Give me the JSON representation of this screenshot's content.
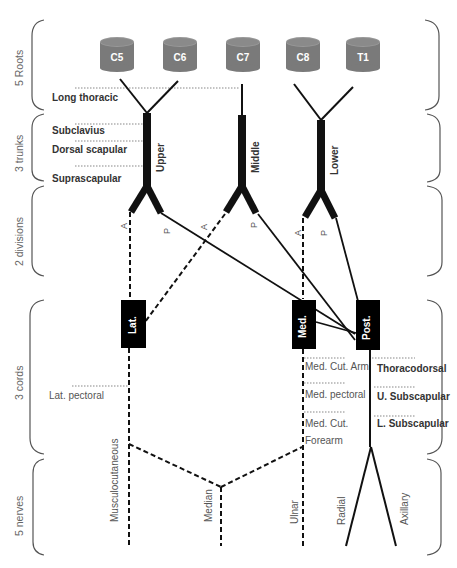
{
  "sections": [
    {
      "label": "5 Roots"
    },
    {
      "label": "3 trunks"
    },
    {
      "label": "2 divisions"
    },
    {
      "label": "3 cords"
    },
    {
      "label": "5 nerves"
    }
  ],
  "roots": [
    {
      "label": "C5"
    },
    {
      "label": "C6"
    },
    {
      "label": "C7"
    },
    {
      "label": "C8"
    },
    {
      "label": "T1"
    }
  ],
  "trunks": [
    {
      "label": "Upper"
    },
    {
      "label": "Middle"
    },
    {
      "label": "Lower"
    }
  ],
  "divisions": {
    "anterior": "A",
    "posterior": "P"
  },
  "cords": [
    {
      "label": "Lat."
    },
    {
      "label": "Med."
    },
    {
      "label": "Post."
    }
  ],
  "branches": {
    "root": [
      {
        "label": "Long thoracic"
      }
    ],
    "upper_trunk": [
      {
        "label": "Subclavius"
      },
      {
        "label": "Dorsal scapular"
      },
      {
        "label": "Suprascapular"
      }
    ],
    "lateral_cord": [
      {
        "label": "Lat. pectoral"
      }
    ],
    "medial_cord": [
      {
        "label": "Med. Cut. Arm"
      },
      {
        "label": "Med. pectoral"
      },
      {
        "label": "Med. Cut."
      },
      {
        "label": "Forearm"
      }
    ],
    "posterior_cord": [
      {
        "label": "Thoracodorsal"
      },
      {
        "label": "U. Subscapular"
      },
      {
        "label": "L. Subscapular"
      }
    ]
  },
  "nerves": [
    {
      "label": "Musculocutaneous"
    },
    {
      "label": "Median"
    },
    {
      "label": "Ulnar"
    },
    {
      "label": "Radial"
    },
    {
      "label": "Axillary"
    }
  ],
  "colors": {
    "root_fill": "#7a7a7a",
    "root_top": "#999999",
    "line": "#111111",
    "dotted": "#888888",
    "bracket": "#555555"
  }
}
